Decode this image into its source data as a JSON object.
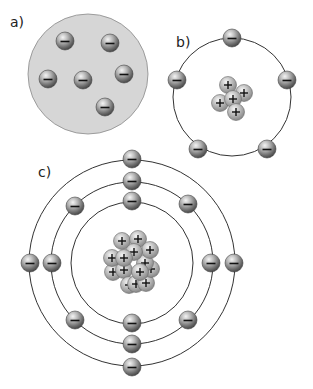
{
  "figure": {
    "panels": [
      {
        "id": "a",
        "label": "a)",
        "label_pos": [
          10,
          28
        ],
        "model": "plum-pudding",
        "sphere": {
          "cx": 88,
          "cy": 74,
          "r": 60,
          "fill": "#d6d6d6",
          "stroke": "#8a8a8a"
        },
        "electrons": [
          [
            65,
            41
          ],
          [
            110,
            43
          ],
          [
            48,
            79
          ],
          [
            83,
            80
          ],
          [
            124,
            74
          ],
          [
            105,
            107
          ]
        ]
      },
      {
        "id": "b",
        "label": "b)",
        "label_pos": [
          176,
          48
        ],
        "model": "bohr-single-shell",
        "center": [
          232,
          97
        ],
        "orbits": [
          59
        ],
        "electrons": [
          [
            232,
            38
          ],
          [
            177,
            80
          ],
          [
            287,
            80
          ],
          [
            198,
            149
          ],
          [
            267,
            149
          ]
        ],
        "nucleus": [
          [
            228,
            85
          ],
          [
            244,
            93
          ],
          [
            220,
            103
          ],
          [
            233,
            99
          ],
          [
            236,
            112
          ]
        ]
      },
      {
        "id": "c",
        "label": "c)",
        "label_pos": [
          38,
          178
        ],
        "model": "bohr-three-shells",
        "center": [
          132,
          263
        ],
        "orbits": [
          103,
          81,
          61
        ],
        "electrons": [
          [
            132,
            159
          ],
          [
            132,
            367
          ],
          [
            30,
            263
          ],
          [
            234,
            263
          ],
          [
            132,
            181
          ],
          [
            132,
            344
          ],
          [
            52,
            263
          ],
          [
            211,
            263
          ],
          [
            75,
            206
          ],
          [
            188,
            204
          ],
          [
            75,
            320
          ],
          [
            188,
            320
          ],
          [
            132,
            201
          ],
          [
            132,
            323
          ]
        ],
        "nucleus": [
          [
            113,
            272
          ],
          [
            124,
            270
          ],
          [
            129,
            285
          ],
          [
            136,
            284
          ],
          [
            146,
            283
          ],
          [
            112,
            258
          ],
          [
            151,
            269
          ],
          [
            145,
            263
          ],
          [
            122,
            241
          ],
          [
            138,
            239
          ],
          [
            150,
            250
          ],
          [
            134,
            252
          ],
          [
            124,
            258
          ],
          [
            140,
            272
          ]
        ]
      }
    ],
    "electron": {
      "r": 9,
      "symbol": "−"
    },
    "proton": {
      "r": 8.5,
      "symbol": "+"
    },
    "colors": {
      "orbit": "#333333",
      "sphere_fill": "#d6d6d6"
    }
  }
}
